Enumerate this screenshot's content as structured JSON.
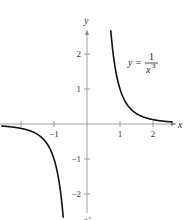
{
  "chart_data": {
    "type": "line",
    "title": "",
    "xlabel": "x",
    "ylabel": "y",
    "xlim": [
      -2.6,
      2.6
    ],
    "ylim": [
      -2.6,
      2.6
    ],
    "grid": false,
    "x_ticks": [
      -2,
      -1,
      1,
      2
    ],
    "x_tick_labels": [
      "",
      "−1",
      "1",
      "2"
    ],
    "y_ticks": [
      -2,
      -1,
      1,
      2
    ],
    "y_tick_labels": [
      "−2",
      "−1",
      "1",
      "2"
    ],
    "series": [
      {
        "name": "y = 1/x^3",
        "function": "1/x^3",
        "branches": [
          {
            "x_range": [
              0.72,
              2.6
            ]
          },
          {
            "x_range": [
              -2.6,
              -0.72
            ]
          }
        ]
      }
    ],
    "annotation": {
      "lhs": "y =",
      "numerator": "1",
      "denominator": "x",
      "exponent": "3",
      "placement": "upper-right"
    },
    "caption": "c²"
  }
}
